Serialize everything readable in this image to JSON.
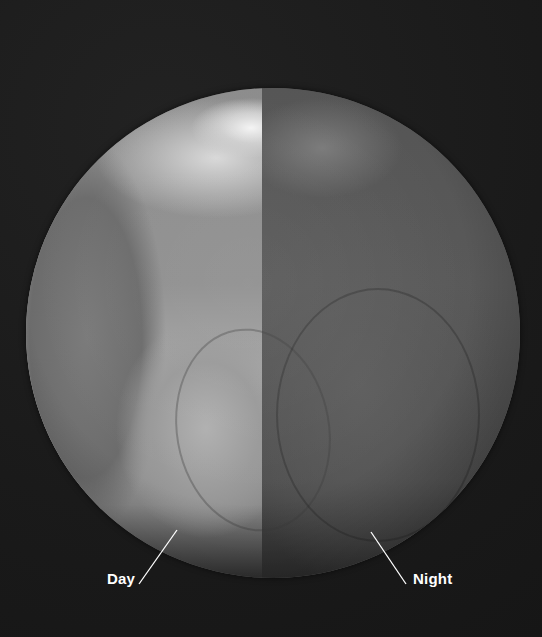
{
  "image": {
    "subject": "Earth globe showing day and night halves",
    "background_color": "#1c1c1c",
    "globe": {
      "day_side_color": "#9a9a9a",
      "night_side_color": "#565656",
      "terminator_x": 262
    }
  },
  "labels": {
    "day": "Day",
    "night": "Night"
  }
}
